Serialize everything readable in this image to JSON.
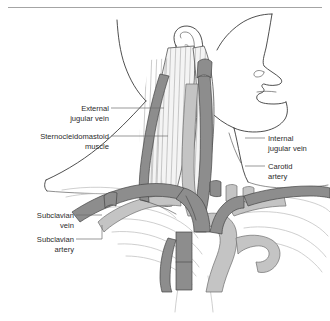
{
  "figure": {
    "background_color": "#ffffff",
    "has_top_rule": true,
    "colors": {
      "vein_fill": "#8d8d8d",
      "artery_fill": "#c4c4c4",
      "muscle_fill": "#f4f4f4",
      "outline": "#2f2f2f",
      "bone_outline": "#c3c3c3",
      "leader_line": "#6d6d6d",
      "label_text": "#2b2b2b",
      "rule": "#9a9a9a"
    }
  },
  "labels": {
    "left": [
      {
        "id": "external-jugular-vein",
        "lines": [
          "External",
          "jugular vein"
        ],
        "align": "right"
      },
      {
        "id": "sternocleidomastoid-muscle",
        "lines": [
          "Sternocleidomastoid",
          "muscle"
        ],
        "align": "right"
      },
      {
        "id": "subclavian-vein",
        "lines": [
          "Subclavian",
          "vein"
        ],
        "align": "right"
      },
      {
        "id": "subclavian-artery",
        "lines": [
          "Subclavian",
          "artery"
        ],
        "align": "right"
      }
    ],
    "right": [
      {
        "id": "internal-jugular-vein",
        "lines": [
          "Internal",
          "jugular vein"
        ],
        "align": "left"
      },
      {
        "id": "carotid-artery",
        "lines": [
          "Carotid",
          "artery"
        ],
        "align": "left"
      }
    ]
  },
  "text": {
    "external": "External",
    "external_2": "jugular vein",
    "scm": "Sternocleidomastoid",
    "scm_2": "muscle",
    "subclavian_vein": "Subclavian",
    "subclavian_vein_2": "vein",
    "subclavian_artery": "Subclavian",
    "subclavian_artery_2": "artery",
    "internal": "Internal",
    "internal_2": "jugular vein",
    "carotid": "Carotid",
    "carotid_2": "artery"
  },
  "structures": [
    {
      "name": "head-profile",
      "type": "outline"
    },
    {
      "name": "ear",
      "type": "outline"
    },
    {
      "name": "neck-contour",
      "type": "outline"
    },
    {
      "name": "shoulder-contour",
      "type": "outline"
    },
    {
      "name": "sternocleidomastoid-muscle",
      "type": "muscle"
    },
    {
      "name": "clavicle",
      "type": "bone"
    },
    {
      "name": "rib-cage",
      "type": "bone"
    },
    {
      "name": "external-jugular-vein",
      "type": "vein"
    },
    {
      "name": "internal-jugular-vein",
      "type": "vein"
    },
    {
      "name": "subclavian-vein",
      "type": "vein"
    },
    {
      "name": "brachiocephalic-vein",
      "type": "vein"
    },
    {
      "name": "superior-vena-cava",
      "type": "vein"
    },
    {
      "name": "carotid-artery",
      "type": "artery"
    },
    {
      "name": "subclavian-artery",
      "type": "artery"
    },
    {
      "name": "aortic-arch",
      "type": "artery"
    }
  ]
}
